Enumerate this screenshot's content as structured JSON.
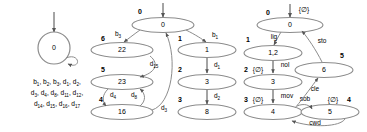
{
  "figure": {
    "colors": {
      "node_stroke": "#8c8c8c",
      "edge_stroke": "#8c8c8c",
      "text": "#000000",
      "background": "#ffffff"
    }
  },
  "panel_left": {
    "name": "single-state-automaton",
    "start_arrow": true,
    "nodes": [
      {
        "id": "n0",
        "label": "0",
        "shape": "circle"
      }
    ],
    "self_loop": {
      "from": "n0",
      "to": "n0",
      "label": ""
    },
    "caption_lines": [
      "b₁ , b₂ , b₃ , d₁ , d₂ ,",
      "d₃ , d₄ , d₈ , d₁₁ , d₁₂ ,",
      "d₁₄ , d₁₅ , d₁₆ , d₁₇"
    ],
    "caption_parts": [
      [
        "b",
        "1"
      ],
      [
        "b",
        "2"
      ],
      [
        "b",
        "3"
      ],
      [
        "d",
        "1"
      ],
      [
        "d",
        "2"
      ],
      [
        "d",
        "3"
      ],
      [
        "d",
        "4"
      ],
      [
        "d",
        "8"
      ],
      [
        "d",
        "11"
      ],
      [
        "d",
        "12"
      ],
      [
        "d",
        "14"
      ],
      [
        "d",
        "15"
      ],
      [
        "d",
        "16"
      ],
      [
        "d",
        "17"
      ]
    ]
  },
  "panel_middle": {
    "name": "numbered-state-automaton",
    "start_arrow": true,
    "nodes": [
      {
        "id": "m0",
        "state": "0",
        "index": "0",
        "shape": "ellipse"
      },
      {
        "id": "m1",
        "state": "1",
        "index": "1",
        "shape": "ellipse"
      },
      {
        "id": "m3",
        "state": "3",
        "index": "2",
        "shape": "ellipse"
      },
      {
        "id": "m8",
        "state": "8",
        "index": "3",
        "shape": "ellipse"
      },
      {
        "id": "m22",
        "state": "22",
        "index": "6",
        "shape": "ellipse"
      },
      {
        "id": "m23",
        "state": "23",
        "index": "5",
        "shape": "ellipse"
      },
      {
        "id": "m16",
        "state": "16",
        "index": "4",
        "shape": "ellipse"
      }
    ],
    "edges": [
      {
        "from": "m0",
        "to": "m1",
        "label": "b₁",
        "base": "b",
        "sub": "1"
      },
      {
        "from": "m1",
        "to": "m3",
        "label": "d₁",
        "base": "d",
        "sub": "1"
      },
      {
        "from": "m3",
        "to": "m8",
        "label": "d₂",
        "base": "d",
        "sub": "2"
      },
      {
        "from": "m0",
        "to": "m22",
        "label": "b₃",
        "base": "b",
        "sub": "3"
      },
      {
        "from": "m22",
        "to": "m23",
        "label": "d₁₅",
        "base": "d",
        "sub": "15"
      },
      {
        "from": "m23",
        "to": "m16",
        "label": "d₄",
        "base": "d",
        "sub": "4"
      },
      {
        "from": "m16",
        "to": "m23",
        "label": "d₈",
        "base": "d",
        "sub": "8"
      },
      {
        "from": "m16",
        "to": "m0",
        "label": "d₃",
        "base": "d",
        "sub": "3"
      }
    ]
  },
  "panel_right": {
    "name": "command-labeled-automaton",
    "start_arrow": true,
    "start_label": "{∅}",
    "nodes": [
      {
        "id": "r0",
        "state": "0",
        "index": "0",
        "mark": "",
        "shape": "ellipse"
      },
      {
        "id": "r1",
        "state": "1,2",
        "index": "1",
        "mark": "",
        "shape": "ellipse"
      },
      {
        "id": "r3",
        "state": "3",
        "index": "2",
        "mark": "{∅}",
        "shape": "ellipse"
      },
      {
        "id": "r4",
        "state": "4",
        "index": "3",
        "mark": "{∅}",
        "shape": "ellipse"
      },
      {
        "id": "r5",
        "state": "5",
        "index": "4",
        "mark": "{∅}",
        "shape": "ellipse"
      },
      {
        "id": "r6",
        "state": "6",
        "index": "5",
        "mark": "",
        "shape": "ellipse"
      }
    ],
    "edges": [
      {
        "from": "r0",
        "to": "r1",
        "label": "lig"
      },
      {
        "from": "r1",
        "to": "r3",
        "label": "nol"
      },
      {
        "from": "r3",
        "to": "r4",
        "label": "mov"
      },
      {
        "from": "r4",
        "to": "r5",
        "label": "sob"
      },
      {
        "from": "r5",
        "to": "r4",
        "label": "cwd"
      },
      {
        "from": "r4",
        "to": "r6",
        "label": "cle"
      },
      {
        "from": "r6",
        "to": "r0",
        "label": "sto"
      }
    ]
  }
}
